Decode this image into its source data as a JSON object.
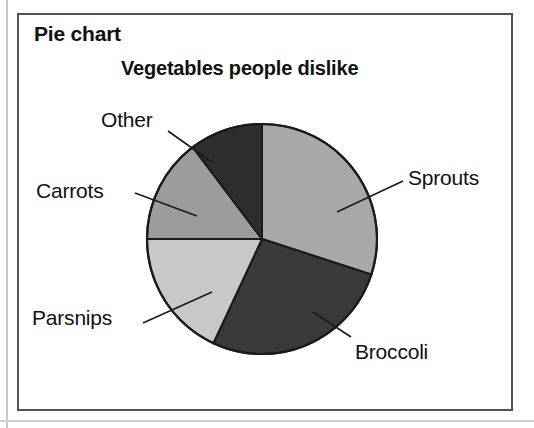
{
  "panel": {
    "label": "Pie chart"
  },
  "chart_data": {
    "type": "pie",
    "title": "Vegetables people dislike",
    "xlabel": "",
    "ylabel": "",
    "grid": false,
    "legend_position": "callout-labels",
    "start_angle_deg": 0,
    "direction": "clockwise",
    "center": {
      "x": 262,
      "y": 239
    },
    "radius": 115,
    "categories": [
      "Sprouts",
      "Broccoli",
      "Parsnips",
      "Carrots",
      "Other"
    ],
    "values": [
      30,
      27,
      18,
      15,
      10
    ],
    "slices": [
      {
        "label": "Sprouts",
        "value": 30,
        "start_angle_deg": 0,
        "end_angle_deg": 108,
        "sweep_deg": 108,
        "color": "#a8a8a8",
        "label_x": 408,
        "label_y": 166
      },
      {
        "label": "Broccoli",
        "value": 27,
        "start_angle_deg": 108,
        "end_angle_deg": 205,
        "sweep_deg": 97,
        "color": "#3a3a3a",
        "label_x": 355,
        "label_y": 340
      },
      {
        "label": "Parsnips",
        "value": 18,
        "start_angle_deg": 205,
        "end_angle_deg": 270,
        "sweep_deg": 65,
        "color": "#c8c8c8",
        "label_x": 32,
        "label_y": 306
      },
      {
        "label": "Carrots",
        "value": 15,
        "start_angle_deg": 270,
        "end_angle_deg": 323,
        "sweep_deg": 53,
        "color": "#9c9c9c",
        "label_x": 36,
        "label_y": 179
      },
      {
        "label": "Other",
        "value": 10,
        "start_angle_deg": 323,
        "end_angle_deg": 360,
        "sweep_deg": 37,
        "color": "#2e2e2e",
        "label_x": 101,
        "label_y": 108
      }
    ],
    "leader_lines": [
      {
        "label": "Other",
        "from_x": 168,
        "from_y": 131,
        "to_x": 213,
        "to_y": 163
      },
      {
        "label": "Carrots",
        "from_x": 135,
        "from_y": 193,
        "to_x": 197,
        "to_y": 216
      },
      {
        "label": "Parsnips",
        "from_x": 143,
        "from_y": 323,
        "to_x": 212,
        "to_y": 292
      },
      {
        "label": "Broccoli",
        "from_x": 351,
        "from_y": 337,
        "to_x": 313,
        "to_y": 312
      },
      {
        "label": "Sprouts",
        "from_x": 403,
        "from_y": 181,
        "to_x": 337,
        "to_y": 212
      }
    ],
    "colors": {
      "outline": "#1a1a1a",
      "background": "#ffffff",
      "text": "#111111",
      "frame": "#555555"
    }
  }
}
